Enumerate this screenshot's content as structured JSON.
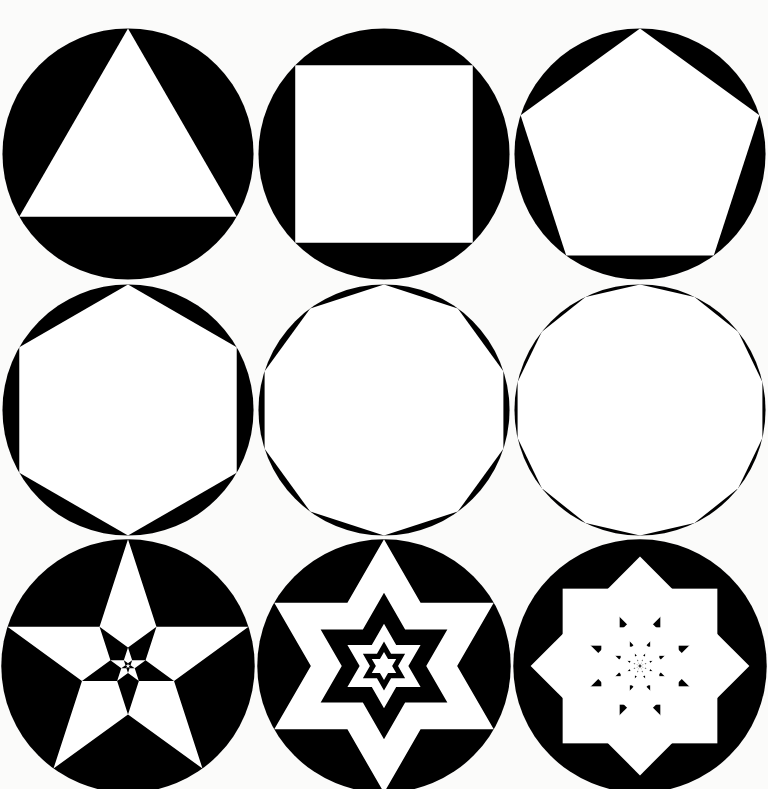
{
  "canvas": {
    "width": 768,
    "height": 789,
    "background_color": "#fbfbfa",
    "ink_color": "#000000",
    "paper_color": "#ffffff"
  },
  "figure": {
    "layout": "3x3 grid",
    "rows": 3,
    "columns": 3,
    "disc_radius": 108,
    "stroke": "none"
  },
  "cells": [
    {
      "index": 1,
      "name": "triangle-in-circle",
      "kind": "inscribed-polygon",
      "sides": 3,
      "polygon_name": "triangle",
      "orientation_deg": -90,
      "fill": "#ffffff",
      "disc_fill": "#000000",
      "center": [
        143,
        142
      ],
      "radius": 107
    },
    {
      "index": 2,
      "name": "square-in-circle",
      "kind": "inscribed-polygon",
      "sides": 4,
      "polygon_name": "square",
      "orientation_deg": -45,
      "fill": "#ffffff",
      "disc_fill": "#000000",
      "center": [
        384,
        142
      ],
      "radius": 107
    },
    {
      "index": 3,
      "name": "pentagon-in-circle",
      "kind": "inscribed-polygon",
      "sides": 5,
      "polygon_name": "pentagon",
      "orientation_deg": -90,
      "fill": "#ffffff",
      "disc_fill": "#000000",
      "center": [
        622,
        142
      ],
      "radius": 107
    },
    {
      "index": 4,
      "name": "hexagon-in-circle",
      "kind": "inscribed-polygon",
      "sides": 6,
      "polygon_name": "hexagon",
      "orientation_deg": -90,
      "fill": "#ffffff",
      "disc_fill": "#000000",
      "center": [
        143,
        392
      ],
      "radius": 107
    },
    {
      "index": 5,
      "name": "decagon-in-circle",
      "kind": "inscribed-polygon",
      "sides": 10,
      "polygon_name": "decagon",
      "orientation_deg": -90,
      "fill": "#ffffff",
      "disc_fill": "#000000",
      "center": [
        384,
        392
      ],
      "radius": 107
    },
    {
      "index": 6,
      "name": "tetradecagon-in-circle",
      "kind": "inscribed-polygon",
      "sides": 14,
      "polygon_name": "tetradecagon",
      "orientation_deg": -90,
      "fill": "#ffffff",
      "disc_fill": "#000000",
      "center": [
        622,
        392
      ],
      "radius": 107
    },
    {
      "index": 7,
      "name": "recursive-pentagram",
      "kind": "recursive-star",
      "points": 5,
      "polygon_name": "pentagram",
      "orientation_deg": -90,
      "depth": 5,
      "scale_ratio": 0.382,
      "rotation_step_deg": 180,
      "fill": "#ffffff",
      "disc_fill": "#000000",
      "center": [
        143,
        640
      ],
      "radius": 107
    },
    {
      "index": 8,
      "name": "recursive-hexagram",
      "kind": "recursive-star",
      "points": 6,
      "polygon_name": "hexagram",
      "orientation_deg": -90,
      "depth": 5,
      "scale_ratio": 0.4472,
      "rotation_step_deg": 0,
      "fill": "#ffffff",
      "disc_fill": "#000000",
      "center": [
        384,
        640
      ],
      "radius": 107
    },
    {
      "index": 9,
      "name": "recursive-octagram-squares",
      "kind": "recursive-square-rosette",
      "points": 8,
      "polygon_name": "octagram",
      "orientation_deg": 0,
      "depth": 6,
      "scale_ratio": 0.5,
      "rotation_step_deg": 45,
      "fill": "#ffffff",
      "disc_fill": "#000000",
      "center": [
        622,
        640
      ],
      "radius": 107
    }
  ]
}
